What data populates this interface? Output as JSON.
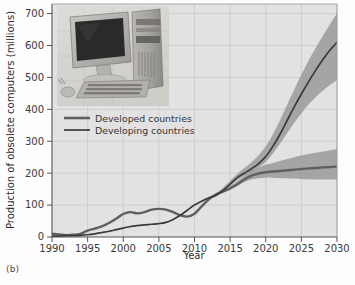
{
  "figure": {
    "caption": "(b)",
    "inset_image": "desktop-computer-photo"
  },
  "chart_data": {
    "type": "line",
    "title": "",
    "xlabel": "Year",
    "ylabel": "Production of obsolete computers (millions)",
    "xlim": [
      1990,
      2030
    ],
    "ylim": [
      0,
      730
    ],
    "xticks": [
      1990,
      1995,
      2000,
      2005,
      2010,
      2015,
      2020,
      2025,
      2030
    ],
    "yticks": [
      0,
      100,
      200,
      300,
      400,
      500,
      600,
      700
    ],
    "grid": true,
    "legend_position": "upper-left-inside",
    "colors": {
      "developed_line": "#5f5f5f",
      "developing_line": "#3a3a3a",
      "band": "#9a9a9a",
      "plot_background": "#e2e2e2",
      "axis": "#555555",
      "gridline": "#c9c9c9"
    },
    "x": [
      1990,
      1991,
      1992,
      1993,
      1994,
      1995,
      1996,
      1997,
      1998,
      1999,
      2000,
      2001,
      2002,
      2003,
      2004,
      2005,
      2006,
      2007,
      2008,
      2009,
      2010,
      2011,
      2012,
      2013,
      2014,
      2015,
      2016,
      2017,
      2018,
      2019,
      2020,
      2021,
      2022,
      2023,
      2024,
      2025,
      2026,
      2027,
      2028,
      2029,
      2030
    ],
    "series": [
      {
        "name": "Developed countries",
        "values": [
          10,
          8,
          6,
          7,
          10,
          20,
          26,
          33,
          44,
          57,
          72,
          78,
          74,
          78,
          86,
          88,
          86,
          78,
          68,
          64,
          73,
          96,
          118,
          133,
          142,
          152,
          165,
          180,
          192,
          199,
          203,
          205,
          207,
          209,
          211,
          213,
          215,
          216,
          218,
          219,
          221
        ],
        "band_lower": [
          10,
          8,
          6,
          7,
          10,
          20,
          26,
          33,
          44,
          57,
          72,
          78,
          74,
          78,
          86,
          88,
          86,
          78,
          68,
          64,
          73,
          96,
          118,
          133,
          142,
          150,
          160,
          172,
          180,
          184,
          186,
          186,
          185,
          184,
          183,
          182,
          181,
          180,
          180,
          180,
          180
        ],
        "band_upper": [
          10,
          8,
          6,
          7,
          10,
          20,
          26,
          33,
          44,
          57,
          72,
          78,
          74,
          78,
          86,
          88,
          86,
          78,
          68,
          64,
          73,
          96,
          118,
          135,
          148,
          160,
          175,
          192,
          208,
          218,
          226,
          232,
          238,
          244,
          250,
          255,
          260,
          264,
          268,
          272,
          276
        ],
        "value_2030": 221
      },
      {
        "name": "Developing countries",
        "values": [
          3,
          3,
          4,
          4,
          5,
          7,
          10,
          14,
          18,
          23,
          28,
          33,
          36,
          38,
          40,
          42,
          46,
          55,
          68,
          84,
          100,
          112,
          122,
          130,
          146,
          166,
          186,
          200,
          214,
          230,
          252,
          284,
          322,
          365,
          408,
          448,
          486,
          522,
          555,
          585,
          610
        ],
        "band_lower": [
          3,
          3,
          4,
          4,
          5,
          7,
          10,
          14,
          18,
          23,
          28,
          33,
          36,
          38,
          40,
          42,
          46,
          55,
          68,
          84,
          100,
          112,
          122,
          128,
          142,
          160,
          178,
          192,
          204,
          218,
          236,
          262,
          292,
          325,
          358,
          388,
          415,
          438,
          458,
          476,
          492
        ],
        "band_upper": [
          3,
          3,
          4,
          4,
          5,
          7,
          10,
          14,
          18,
          23,
          28,
          33,
          36,
          38,
          40,
          42,
          46,
          55,
          68,
          84,
          100,
          114,
          126,
          136,
          154,
          176,
          198,
          216,
          234,
          256,
          284,
          322,
          366,
          414,
          462,
          508,
          552,
          592,
          630,
          666,
          700
        ],
        "value_2030": 610
      }
    ],
    "legend": [
      {
        "label": "Developed countries",
        "color": "#5f5f5f",
        "width": 2.6
      },
      {
        "label": "Developing countries",
        "color": "#3a3a3a",
        "width": 1.7
      }
    ]
  }
}
